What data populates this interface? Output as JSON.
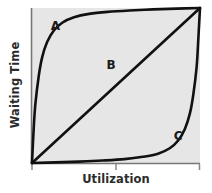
{
  "chart_data": {
    "type": "line",
    "title": "",
    "subtitle": "",
    "xlabel": "Utilization",
    "ylabel": "Waiting Time",
    "xlim": [
      0,
      1
    ],
    "ylim": [
      0,
      1
    ],
    "grid": false,
    "legend_position": "inline-annotations",
    "xticklabels": [],
    "yticklabels": [],
    "xticks": [
      0,
      0.5,
      1
    ],
    "yticks": [],
    "plot_background_color": "#e6e6e6",
    "line_color": "#111111",
    "series": [
      {
        "name": "A",
        "shape": "concave",
        "annotation": "A",
        "annotation_x": 0.14,
        "annotation_y": 0.86,
        "x": [
          0.0,
          0.01,
          0.02,
          0.04,
          0.06,
          0.09,
          0.13,
          0.18,
          0.25,
          0.34,
          0.45,
          0.58,
          0.72,
          0.86,
          1.0
        ],
        "y": [
          0.0,
          0.22,
          0.38,
          0.56,
          0.68,
          0.78,
          0.855,
          0.905,
          0.94,
          0.962,
          0.975,
          0.984,
          0.991,
          0.996,
          1.0
        ]
      },
      {
        "name": "B",
        "shape": "linear",
        "annotation": "B",
        "annotation_x": 0.47,
        "annotation_y": 0.61,
        "x": [
          0.0,
          1.0
        ],
        "y": [
          0.0,
          1.0
        ]
      },
      {
        "name": "C",
        "shape": "convex",
        "annotation": "C",
        "annotation_x": 0.87,
        "annotation_y": 0.15,
        "x": [
          0.0,
          0.14,
          0.28,
          0.42,
          0.55,
          0.66,
          0.75,
          0.82,
          0.87,
          0.91,
          0.94,
          0.96,
          0.98,
          0.99,
          1.0
        ],
        "y": [
          0.0,
          0.004,
          0.009,
          0.016,
          0.025,
          0.04,
          0.06,
          0.095,
          0.145,
          0.22,
          0.32,
          0.44,
          0.62,
          0.8,
          1.0
        ]
      }
    ]
  },
  "axes": {
    "ylabel": "Waiting Time",
    "xlabel": "Utilization"
  },
  "annotations": {
    "a": "A",
    "b": "B",
    "c": "C"
  }
}
